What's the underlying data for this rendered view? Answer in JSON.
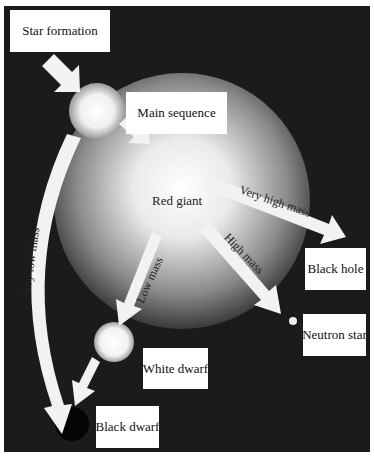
{
  "diagram": {
    "nodes": [
      {
        "id": "star_formation",
        "label": "Star formation"
      },
      {
        "id": "main_sequence",
        "label": "Main sequence"
      },
      {
        "id": "red_giant",
        "label": "Red giant"
      },
      {
        "id": "black_hole",
        "label": "Black hole"
      },
      {
        "id": "neutron_star",
        "label": "Neutron star"
      },
      {
        "id": "white_dwarf",
        "label": "White dwarf"
      },
      {
        "id": "black_dwarf",
        "label": "Black dwarf"
      }
    ],
    "edges": [
      {
        "from": "star_formation",
        "to": "main_sequence",
        "label": ""
      },
      {
        "from": "main_sequence",
        "to": "red_giant",
        "label": ""
      },
      {
        "from": "main_sequence",
        "to": "black_dwarf",
        "label": "Very low mass"
      },
      {
        "from": "red_giant",
        "to": "black_hole",
        "label": "Very high mass"
      },
      {
        "from": "red_giant",
        "to": "neutron_star",
        "label": "High mass"
      },
      {
        "from": "red_giant",
        "to": "white_dwarf",
        "label": "Low mass"
      },
      {
        "from": "white_dwarf",
        "to": "black_dwarf",
        "label": ""
      }
    ],
    "colors": {
      "background": "#1b1b1b",
      "label_box": "#ffffff",
      "arrow": "#f2f2f2"
    }
  }
}
